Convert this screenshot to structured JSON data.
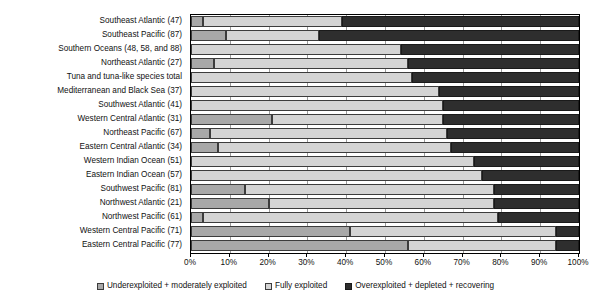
{
  "chart_data": {
    "type": "bar",
    "orientation": "horizontal",
    "stacked": true,
    "normalized": true,
    "title": "",
    "subtitle": "",
    "xlabel": "",
    "ylabel": "",
    "xlim": [
      0,
      100
    ],
    "grid": true,
    "legend_position": "bottom",
    "xticks": [
      "0%",
      "10%",
      "20%",
      "30%",
      "40%",
      "50%",
      "60%",
      "70%",
      "80%",
      "90%",
      "100%"
    ],
    "xtick_values": [
      0,
      10,
      20,
      30,
      40,
      50,
      60,
      70,
      80,
      90,
      100
    ],
    "categories": [
      "Southeast Atlantic (47)",
      "Southeast  Pacific (87)",
      "Southern Oceans (48, 58, and 88)",
      "Northeast Atlantic (27)",
      "Tuna and tuna-like species total",
      "Mediterranean and Black Sea (37)",
      "Southwest Atlantic (41)",
      "Western Central Atlantic (31)",
      "Northeast Pacific (67)",
      "Eastern Central Atlantic (34)",
      "Western Indian Ocean (51)",
      "Eastern Indian Ocean (57)",
      "Southwest Pacific (81)",
      "Northwest Atlantic (21)",
      "Northwest Pacific (61)",
      "Western Central Pacific (71)",
      "Eastern Central Pacific (77)"
    ],
    "series": [
      {
        "name": "Underexploited + moderately exploited",
        "color": "#a8a8a8",
        "values": [
          3,
          9,
          0,
          6,
          0,
          0,
          0,
          21,
          5,
          7,
          0,
          0,
          14,
          20,
          3,
          41,
          56
        ]
      },
      {
        "name": "Fully exploited",
        "color": "#d4d4d4",
        "values": [
          36,
          24,
          54,
          50,
          57,
          64,
          65,
          44,
          61,
          60,
          73,
          75,
          64,
          58,
          76,
          53,
          38
        ]
      },
      {
        "name": "Overexploited + depleted + recovering",
        "color": "#2e2e2e",
        "values": [
          61,
          67,
          46,
          44,
          43,
          36,
          35,
          35,
          34,
          33,
          27,
          25,
          22,
          22,
          21,
          6,
          6
        ]
      }
    ]
  },
  "legend": {
    "items": [
      {
        "label": "Underexploited + moderately exploited",
        "swatch": "legend-swatch-underexploited"
      },
      {
        "label": "Fully exploited",
        "swatch": "legend-swatch-fully-exploited"
      },
      {
        "label": "Overexploited + depleted + recovering",
        "swatch": "legend-swatch-overexploited"
      }
    ]
  }
}
